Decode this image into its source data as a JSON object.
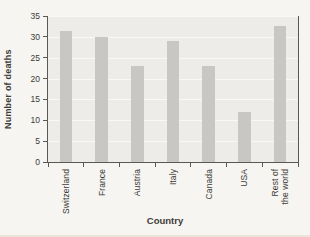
{
  "chart_data": {
    "type": "bar",
    "categories": [
      "Switzerland",
      "France",
      "Austria",
      "Italy",
      "Canada",
      "USA",
      "Rest of\nthe world"
    ],
    "values": [
      31.5,
      30,
      23,
      29,
      23,
      12,
      32.5
    ],
    "title": "",
    "xlabel": "Country",
    "ylabel": "Number of deaths",
    "ylim": [
      0,
      35
    ],
    "yticks": [
      0,
      5,
      10,
      15,
      20,
      25,
      30,
      35
    ],
    "ytick_step": 5,
    "grid": true,
    "legend": "none",
    "bar_width_px": 12.5
  },
  "colors": {
    "figure_bg": "#f6f5f1",
    "plot_bg": "#edece8",
    "gridline": "#f9f8f4",
    "bar": "#c8c7c3",
    "axis": "#5a5852",
    "text": "#3c3b36",
    "page_edge": "#eae5d8"
  }
}
